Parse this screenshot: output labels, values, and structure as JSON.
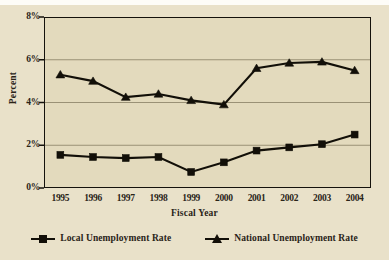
{
  "chart_data": {
    "type": "line",
    "title": "",
    "xlabel": "Fiscal Year",
    "ylabel": "Percent",
    "categories": [
      "1995",
      "1996",
      "1997",
      "1998",
      "1999",
      "2000",
      "2001",
      "2002",
      "2003",
      "2004"
    ],
    "ylim": [
      0,
      8
    ],
    "yticks": [
      0,
      2,
      4,
      6,
      8
    ],
    "ytick_labels": [
      "0%",
      "2%",
      "4%",
      "6%",
      "8%"
    ],
    "grid": true,
    "legend_position": "bottom",
    "series": [
      {
        "name": "Local Unemployment Rate",
        "marker": "square",
        "color": "#120f08",
        "values": [
          1.55,
          1.45,
          1.4,
          1.45,
          0.75,
          1.2,
          1.75,
          1.9,
          2.05,
          2.5
        ]
      },
      {
        "name": "National Unemployment Rate",
        "marker": "triangle",
        "color": "#120f08",
        "values": [
          5.3,
          5.0,
          4.25,
          4.4,
          4.1,
          3.9,
          5.6,
          5.85,
          5.9,
          5.5
        ]
      }
    ]
  },
  "axes": {
    "y_title": "Percent",
    "x_title": "Fiscal Year"
  },
  "colors": {
    "background": "#e9e1c9",
    "plot_background": "#e3dabd",
    "axis": "#15120c",
    "gridline": "#9a9176",
    "series": "#120f08"
  }
}
